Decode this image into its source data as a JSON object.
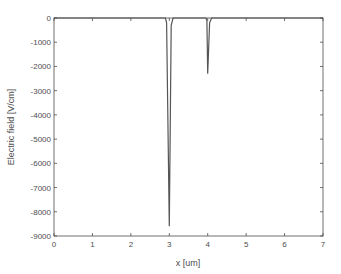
{
  "chart_data": {
    "type": "line",
    "title": "",
    "xlabel": "x [um]",
    "ylabel": "Electric field [V/cm]",
    "xlim": [
      0,
      7
    ],
    "ylim": [
      -9000,
      0
    ],
    "xticks": [
      0,
      1,
      2,
      3,
      4,
      5,
      6,
      7
    ],
    "yticks": [
      0,
      -1000,
      -2000,
      -3000,
      -4000,
      -5000,
      -6000,
      -7000,
      -8000,
      -9000
    ],
    "grid": false,
    "legend": null,
    "series": [
      {
        "name": "Electric field",
        "color": "#555555",
        "x": [
          0,
          2.9,
          2.93,
          3.0,
          3.05,
          3.1,
          3.95,
          3.98,
          4.0,
          4.05,
          4.1,
          7
        ],
        "y": [
          0,
          0,
          -200,
          -8600,
          -300,
          0,
          0,
          -100,
          -2300,
          -200,
          0,
          0
        ]
      }
    ],
    "colors": {
      "axis": "#4d4d4d",
      "line": "#555555",
      "background": "#ffffff"
    }
  }
}
